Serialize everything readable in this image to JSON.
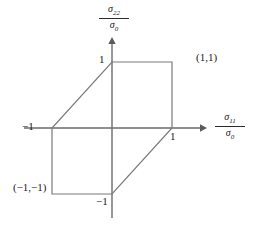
{
  "figure": {
    "axes": {
      "x": {
        "label_numerator": "σ",
        "label_numerator_sub": "11",
        "label_denominator": "σ",
        "label_denominator_sub": "0",
        "label_full": "σ₁₁/σ₀",
        "ticks": [
          {
            "value": -1,
            "text": "−1"
          },
          {
            "value": 1,
            "text": "1"
          }
        ]
      },
      "y": {
        "label_numerator": "σ",
        "label_numerator_sub": "22",
        "label_denominator": "σ",
        "label_denominator_sub": "0",
        "label_full": "σ₂₂/σ₀",
        "ticks": [
          {
            "value": 1,
            "text": "1"
          },
          {
            "value": -1,
            "text": "−1"
          }
        ]
      }
    },
    "annotations": [
      {
        "name": "vertex-label-top-right",
        "text": "(1,1)"
      },
      {
        "name": "vertex-label-bottom-left",
        "text": "(−1,−1)"
      }
    ],
    "colors": {
      "locus_stroke": "#7a7a7a",
      "axis_stroke": "#6b6b6b",
      "text": "#1a1a1a",
      "background": "#ffffff"
    }
  },
  "chart_data": {
    "type": "line",
    "title": "",
    "xlabel": "σ₁₁/σ₀",
    "ylabel": "σ₂₂/σ₀",
    "xlim": [
      -1.45,
      1.5
    ],
    "ylim": [
      -1.4,
      1.35
    ],
    "grid": false,
    "legend": "none",
    "series": [
      {
        "name": "Tresca yield locus",
        "closed": true,
        "x": [
          1,
          0,
          -1,
          -1,
          0,
          1
        ],
        "y": [
          1,
          1,
          0,
          -1,
          -1,
          0
        ],
        "vertices": [
          [
            1,
            1
          ],
          [
            0,
            1
          ],
          [
            -1,
            0
          ],
          [
            -1,
            -1
          ],
          [
            0,
            -1
          ],
          [
            1,
            0
          ]
        ]
      }
    ],
    "xticks": [
      -1,
      1
    ],
    "xticklabels": [
      "−1",
      "1"
    ],
    "yticks": [
      -1,
      1
    ],
    "yticklabels": [
      "−1",
      "1"
    ],
    "point_labels": [
      {
        "x": 1,
        "y": 1,
        "text": "(1,1)"
      },
      {
        "x": -1,
        "y": -1,
        "text": "(−1,−1)"
      }
    ]
  }
}
